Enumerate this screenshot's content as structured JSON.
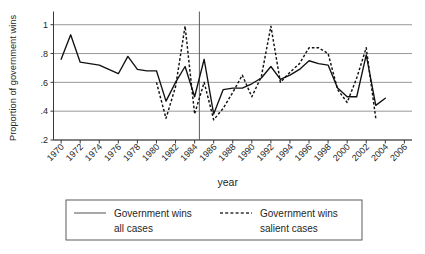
{
  "chart_data": {
    "type": "line",
    "title": "",
    "xlabel": "year",
    "ylabel": "Proportion of government wins",
    "xlim": [
      1969.2,
      2006.8
    ],
    "ylim": [
      0.2,
      1.05
    ],
    "grid": true,
    "legend_position": "below-plot",
    "xticks": [
      1970,
      1972,
      1974,
      1976,
      1978,
      1980,
      1982,
      1984,
      1986,
      1988,
      1990,
      1992,
      1994,
      1996,
      1998,
      2000,
      2002,
      2004,
      2006
    ],
    "xtick_labels": [
      "1970",
      "1972",
      "1974",
      "1976",
      "1978",
      "1980",
      "1982",
      "1984",
      "1986",
      "1988",
      "1990",
      "1992",
      "1994",
      "1996",
      "1998",
      "2000",
      "2002",
      "2004",
      "2006"
    ],
    "yticks": [
      0.2,
      0.4,
      0.6,
      0.8,
      1
    ],
    "ytick_labels": [
      ".2",
      ".4",
      ".6",
      ".8",
      "1"
    ],
    "annotations": [
      {
        "type": "vertical-reference-line",
        "x": 1984.5,
        "label": ""
      }
    ],
    "series": [
      {
        "name": "Government wins all cases",
        "style": "solid",
        "x": [
          1970,
          1971,
          1972,
          1973,
          1974,
          1975,
          1976,
          1977,
          1978,
          1979,
          1980,
          1981,
          1982,
          1983,
          1984,
          1985,
          1986,
          1987,
          1988,
          1989,
          1990,
          1991,
          1992,
          1993,
          1994,
          1995,
          1996,
          1997,
          1998,
          1999,
          2000,
          2001,
          2002,
          2003,
          2004
        ],
        "values": [
          0.76,
          0.93,
          0.74,
          0.73,
          0.72,
          0.69,
          0.66,
          0.78,
          0.69,
          0.68,
          0.68,
          0.47,
          0.6,
          0.71,
          0.5,
          0.76,
          0.38,
          0.55,
          0.56,
          0.56,
          0.59,
          0.63,
          0.71,
          0.62,
          0.65,
          0.69,
          0.75,
          0.73,
          0.72,
          0.56,
          0.5,
          0.5,
          0.79,
          0.44,
          0.49
        ]
      },
      {
        "name": "Government wins salient cases",
        "style": "dashed",
        "x": [
          1980,
          1981,
          1982,
          1983,
          1984,
          1985,
          1986,
          1987,
          1988,
          1989,
          1990,
          1991,
          1992,
          1993,
          1994,
          1995,
          1996,
          1997,
          1998,
          1999,
          2000,
          2001,
          2002,
          2003
        ],
        "values": [
          0.6,
          0.35,
          0.57,
          0.99,
          0.38,
          0.6,
          0.34,
          0.42,
          0.53,
          0.65,
          0.5,
          0.64,
          0.99,
          0.6,
          0.67,
          0.73,
          0.84,
          0.84,
          0.8,
          0.55,
          0.46,
          0.63,
          0.84,
          0.35
        ]
      }
    ]
  },
  "legend": {
    "entries": [
      {
        "line1": "Government wins",
        "line2": "all cases",
        "style": "solid"
      },
      {
        "line1": "Government wins",
        "line2": "salient cases",
        "style": "dashed"
      }
    ]
  }
}
